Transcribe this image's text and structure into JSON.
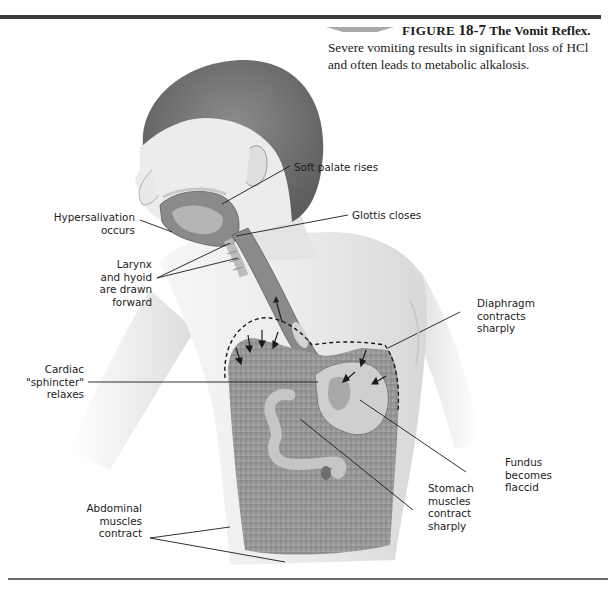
{
  "figure": {
    "label": "FIGURE",
    "number": "18-7",
    "title": "The Vomit Reflex.",
    "caption_text": "Severe vomiting results in significant loss of HCl and often leads to metabolic alkalosis."
  },
  "labels": {
    "soft_palate": "Soft palate rises",
    "glottis": "Glottis closes",
    "hypersalivation": [
      "Hypersalivation",
      "occurs"
    ],
    "larynx": [
      "Larynx",
      "and hyoid",
      "are drawn",
      "forward"
    ],
    "diaphragm": [
      "Diaphragm",
      "contracts",
      "sharply"
    ],
    "cardiac": [
      "Cardiac",
      "\"sphincter\"",
      "relaxes"
    ],
    "fundus": [
      "Fundus",
      "becomes",
      "flaccid"
    ],
    "stomach_muscles": [
      "Stomach",
      "muscles",
      "contract",
      "sharply"
    ],
    "abdominal": [
      "Abdominal",
      "muscles",
      "contract"
    ]
  },
  "colors": {
    "rule": "#3a3a3a",
    "skin": "#e9e9e9",
    "hair": "#7d7d7d",
    "muscle": "#9a9a9a",
    "organ": "#c9c9c9",
    "leader": "#1a1a1a"
  }
}
